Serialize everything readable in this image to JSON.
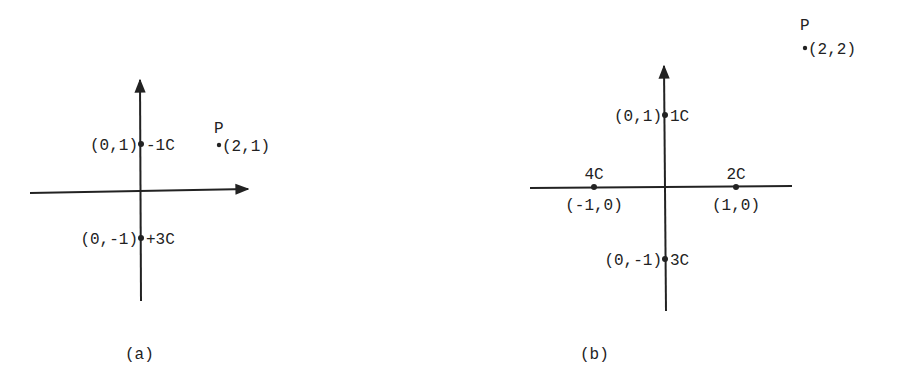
{
  "figure": {
    "panels": [
      {
        "id": "a",
        "caption": "(a)",
        "charges": [
          {
            "coord": "(0,1)",
            "x": 0,
            "y": 1,
            "charge": "-1C",
            "label_side": "left-right"
          },
          {
            "coord": "(0,-1)",
            "x": 0,
            "y": -1,
            "charge": "+3C",
            "label_side": "left-right"
          }
        ],
        "point": {
          "name": "P",
          "coord": "(2,1)",
          "x": 2,
          "y": 1
        }
      },
      {
        "id": "b",
        "caption": "(b)",
        "charges": [
          {
            "coord": "(0,1)",
            "x": 0,
            "y": 1,
            "charge": "1C",
            "label_side": "left-right"
          },
          {
            "coord": "(0,-1)",
            "x": 0,
            "y": -1,
            "charge": "3C",
            "label_side": "left-right"
          },
          {
            "coord": "(1,0)",
            "x": 1,
            "y": 0,
            "charge": "2C",
            "label_side": "above-below"
          },
          {
            "coord": "(-1,0)",
            "x": -1,
            "y": 0,
            "charge": "4C",
            "label_side": "above-below"
          }
        ],
        "point": {
          "name": "P",
          "coord": "(2,2)",
          "x": 2,
          "y": 2
        }
      }
    ]
  }
}
